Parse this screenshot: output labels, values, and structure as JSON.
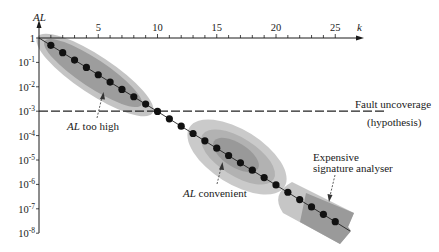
{
  "figure": {
    "y_axis_label": "AL",
    "x_axis_label": "k",
    "threshold": {
      "label_line1": "Fault uncoverage",
      "label_line2": "(hypothesis)"
    },
    "annotations": {
      "too_high": {
        "italic": "AL",
        "text": " too high"
      },
      "convenient": {
        "italic": "AL",
        "text": " convenient"
      },
      "expensive": {
        "line1": "Expensive",
        "line2": "signature analyser"
      }
    },
    "colors": {
      "axis": "#1a1a1a",
      "dots": "#111111",
      "region_light": "#c4c4c4",
      "region_mid": "#adadad",
      "region_dark": "#959595"
    }
  },
  "chart_data": {
    "type": "line",
    "title": "",
    "xlabel": "k",
    "ylabel": "AL",
    "yscale": "log",
    "x_position": "top",
    "xlim": [
      0,
      26
    ],
    "ylim": [
      1e-08,
      1
    ],
    "x_ticks": [
      5,
      10,
      15,
      20,
      25
    ],
    "y_ticks": [
      {
        "value": 1,
        "base": "1",
        "exp": ""
      },
      {
        "value": 0.1,
        "base": "10",
        "exp": "-1"
      },
      {
        "value": 0.01,
        "base": "10",
        "exp": "-2"
      },
      {
        "value": 0.001,
        "base": "10",
        "exp": "-3"
      },
      {
        "value": 0.0001,
        "base": "10",
        "exp": "-4"
      },
      {
        "value": 1e-05,
        "base": "10",
        "exp": "-5"
      },
      {
        "value": 1e-06,
        "base": "10",
        "exp": "-6"
      },
      {
        "value": 1e-07,
        "base": "10",
        "exp": "-7"
      },
      {
        "value": 1e-08,
        "base": "10",
        "exp": "-8"
      }
    ],
    "grid": false,
    "x": [
      1,
      2,
      3,
      4,
      5,
      6,
      7,
      8,
      9,
      10,
      11,
      12,
      13,
      14,
      15,
      16,
      17,
      18,
      19,
      20,
      21,
      22,
      23,
      24,
      25
    ],
    "series": [
      {
        "name": "AL",
        "values": [
          0.5,
          0.25,
          0.125,
          0.0625,
          0.03125,
          0.015625,
          0.0078125,
          0.00390625,
          0.001953125,
          0.0009765625,
          0.00048828,
          0.00024414,
          0.00012207,
          6.1035e-05,
          3.0518e-05,
          1.5259e-05,
          7.6294e-06,
          3.8147e-06,
          1.9073e-06,
          9.5367e-07,
          4.7684e-07,
          2.3842e-07,
          1.1921e-07,
          5.9605e-08,
          2.9802e-08
        ]
      }
    ],
    "reference_lines": [
      {
        "type": "horizontal",
        "y": 0.001,
        "style": "dashed",
        "label": "Fault uncoverage (hypothesis)"
      }
    ],
    "regions": [
      {
        "label": "AL too high",
        "k_range": [
          0,
          10
        ]
      },
      {
        "label": "AL convenient",
        "k_range": [
          12,
          20
        ]
      },
      {
        "label": "Expensive signature analyser",
        "k_range": [
          20,
          26
        ]
      }
    ]
  }
}
